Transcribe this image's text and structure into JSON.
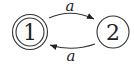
{
  "diagram": {
    "type": "finite-automaton",
    "states": [
      {
        "id": "1",
        "label": "1",
        "accepting": true
      },
      {
        "id": "2",
        "label": "2",
        "accepting": false
      }
    ],
    "transitions": [
      {
        "from": "1",
        "to": "2",
        "label": "a"
      },
      {
        "from": "2",
        "to": "1",
        "label": "a"
      }
    ]
  },
  "colors": {
    "stroke": "#333333",
    "background": "#ffffff"
  }
}
